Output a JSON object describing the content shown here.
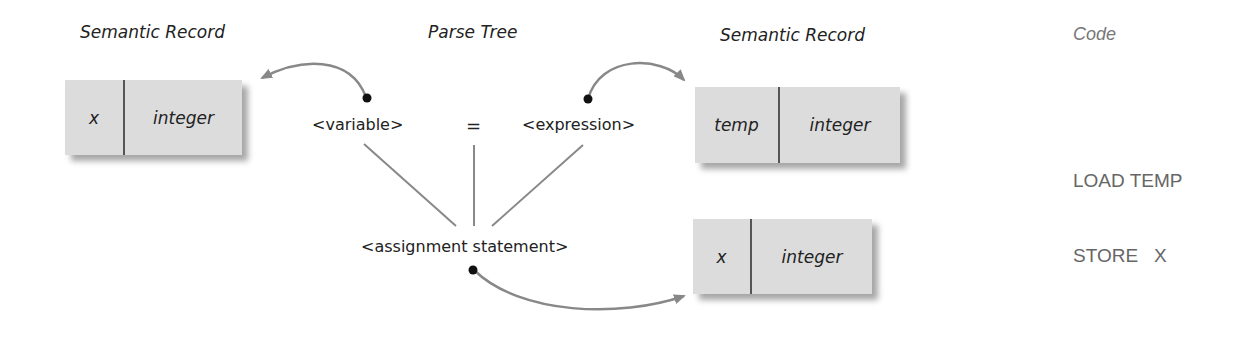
{
  "headings": {
    "left_record": "Semantic Record",
    "parse_tree": "Parse Tree",
    "right_record": "Semantic Record",
    "code": "Code"
  },
  "parse_tree": {
    "variable": "<variable>",
    "equals": "=",
    "expression": "<expression>",
    "assignment": "<assignment statement>"
  },
  "records": {
    "left": {
      "name": "x",
      "type": "integer"
    },
    "right_top": {
      "name": "temp",
      "type": "integer"
    },
    "right_bottom": {
      "name": "x",
      "type": "integer"
    }
  },
  "code": {
    "lines": [
      "LOAD TEMP",
      "STORE   X"
    ]
  },
  "colors": {
    "arrow": "#888888",
    "tree_line": "#888888",
    "record_fill": "#dcdcdc",
    "code_text": "#666666"
  }
}
